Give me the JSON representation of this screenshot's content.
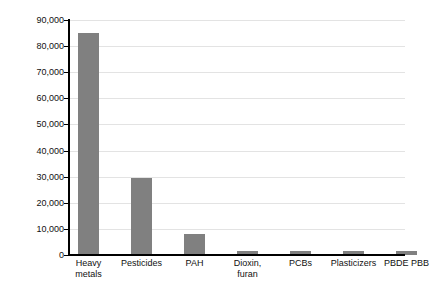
{
  "chart_data": {
    "type": "bar",
    "title": "",
    "xlabel": "",
    "ylabel": "Number of publications",
    "ylim": [
      0,
      90000
    ],
    "grid": true,
    "legend": "none",
    "orientation": "vertical",
    "bar_color": "#808080",
    "axis_color": "#000000",
    "gridline_color": "#e3e3e3",
    "categories": [
      "Heavy metals",
      "Pesticides",
      "PAH",
      "Dioxin, furan",
      "PCBs",
      "Plasticizers",
      "PBDE PBB"
    ],
    "category_label_lines": [
      [
        "Heavy",
        "metals"
      ],
      [
        "Pesticides"
      ],
      [
        "PAH"
      ],
      [
        "Dioxin,",
        "furan"
      ],
      [
        "PCBs"
      ],
      [
        "Plasticizers"
      ],
      [
        "PBDE PBB"
      ]
    ],
    "values": [
      85000,
      29500,
      8000,
      1500,
      1600,
      1700,
      1500
    ],
    "ytick_values": [
      0,
      10000,
      20000,
      30000,
      40000,
      50000,
      60000,
      70000,
      80000,
      90000
    ],
    "ytick_labels": [
      "0",
      "10,000",
      "20,000",
      "30,000",
      "40,000",
      "50,000",
      "60,000",
      "70,000",
      "80,000",
      "90,000"
    ]
  }
}
